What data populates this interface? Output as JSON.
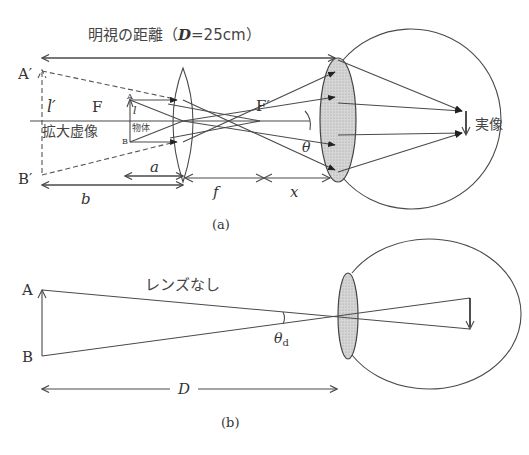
{
  "figure_a": {
    "caption": "(a)",
    "distance_label_prefix": "明視の距離（",
    "distance_label_var": "D",
    "distance_label_suffix": "=25cm）",
    "virtual_image_label": "拡大虚像",
    "object_label": "物体",
    "real_image_label": "実像",
    "point_A_prime": "A′",
    "point_B_prime": "B′",
    "point_A": "A",
    "point_B": "B",
    "focal_point_F": "F",
    "focal_point_F_prime": "F′",
    "image_height": "l′",
    "object_height": "l",
    "dist_a": "a",
    "dist_b": "b",
    "dist_f": "f",
    "dist_x": "x",
    "angle": "θ"
  },
  "figure_b": {
    "caption": "(b)",
    "no_lens_label": "レンズなし",
    "point_A": "A",
    "point_B": "B",
    "angle": "θ",
    "angle_subscript": "d",
    "distance_label": "D"
  }
}
